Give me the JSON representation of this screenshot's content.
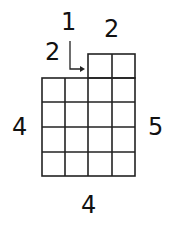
{
  "diagram": {
    "grid": {
      "columns": 4,
      "main_rows": 4,
      "extra_top_row_columns": 2
    },
    "labels": {
      "top_arrow": "1",
      "top_left": "2",
      "top_right": "2",
      "left": "4",
      "right": "5",
      "bottom": "4"
    }
  }
}
